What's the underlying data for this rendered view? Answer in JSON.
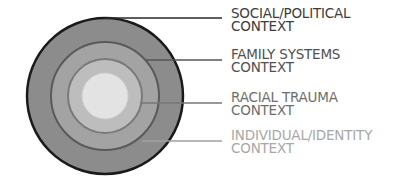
{
  "diagram": {
    "type": "concentric-circles",
    "center": [
      105,
      96
    ],
    "rings": [
      {
        "id": "social-political",
        "radius": 78,
        "fill": "#8c8c8c",
        "stroke": "#1a1a1a",
        "stroke_width": 2.5
      },
      {
        "id": "family-systems",
        "radius": 54,
        "fill": "#a3a3a3",
        "stroke": "#5a5a5a",
        "stroke_width": 2
      },
      {
        "id": "racial-trauma",
        "radius": 37,
        "fill": "#bdbdbd",
        "stroke": "#7a7a7a",
        "stroke_width": 2
      },
      {
        "id": "individual-identity",
        "radius": 23,
        "fill": "#e3e3e3",
        "stroke": "#cfcfcf",
        "stroke_width": 1
      }
    ],
    "labels": [
      {
        "line1": "SOCIAL/POLITICAL",
        "line2": "CONTEXT",
        "color": "#3c3c3c",
        "top": 7,
        "leader": {
          "x1": 105,
          "x2": 222,
          "y": 18,
          "color": "#2a2a2a"
        }
      },
      {
        "line1": "FAMILY SYSTEMS",
        "line2": "CONTEXT",
        "color": "#505050",
        "top": 48,
        "leader": {
          "x1": 146,
          "x2": 222,
          "y": 60,
          "color": "#555555"
        }
      },
      {
        "line1": "RACIAL TRAUMA",
        "line2": "CONTEXT",
        "color": "#6e6e6e",
        "top": 91,
        "leader": {
          "x1": 140,
          "x2": 222,
          "y": 103,
          "color": "#777777"
        }
      },
      {
        "line1": "INDIVIDUAL/IDENTITY",
        "line2": "CONTEXT",
        "color": "#a8a8a8",
        "top": 129,
        "leader": {
          "x1": 142,
          "x2": 222,
          "y": 141,
          "color": "#a0a0a0"
        }
      }
    ]
  }
}
